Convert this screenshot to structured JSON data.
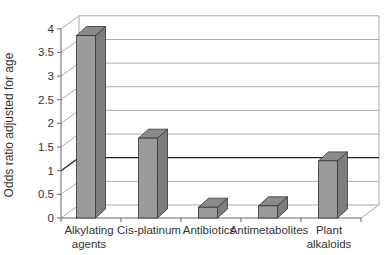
{
  "chart_data": {
    "type": "bar",
    "style": "3d-column",
    "title": "",
    "xlabel": "",
    "ylabel": "Odds ratio adjusted for age",
    "ylim": [
      0,
      4
    ],
    "yticks": [
      "0",
      "0.5",
      "1",
      "1.5",
      "2",
      "2.5",
      "3",
      "3.5",
      "4"
    ],
    "grid": true,
    "reference_line": 1,
    "legend": null,
    "categories": [
      "Alkylating agents",
      "Cis-platinum",
      "Antibiotics",
      "Antimetabolites",
      "Plant alkaloids"
    ],
    "category_lines": [
      [
        "Alkylating",
        "agents"
      ],
      [
        "Cis-platinum"
      ],
      [
        "Antibiotics"
      ],
      [
        "Antimetabolites"
      ],
      [
        "Plant",
        "alkaloids"
      ]
    ],
    "values": [
      3.9,
      1.73,
      0.27,
      0.3,
      1.25
    ]
  },
  "colors": {
    "bar_front": "#9a9a9a",
    "bar_side": "#7d7d7d",
    "bar_top": "#8a8a8a",
    "grid": "#aaaaaa",
    "reference_line": "#222222",
    "axis": "#666666"
  }
}
